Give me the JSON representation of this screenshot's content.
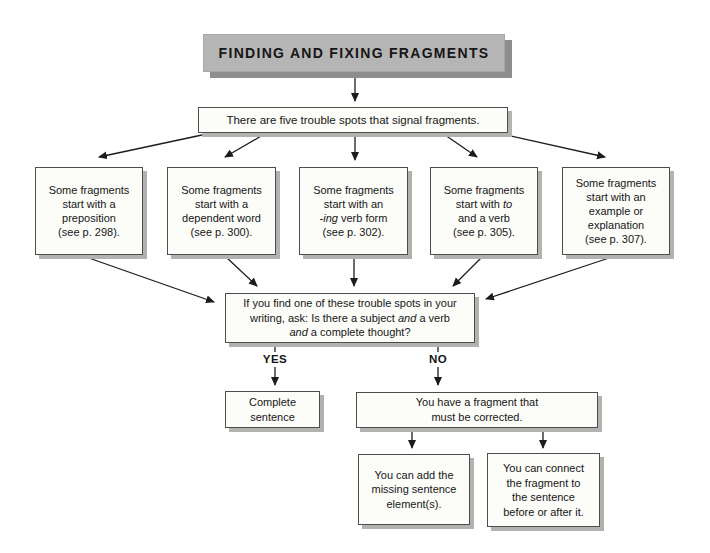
{
  "title": {
    "label": "FINDING AND FIXING FRAGMENTS"
  },
  "intro": {
    "text": "There are five trouble spots that signal fragments."
  },
  "spots": [
    {
      "id": "preposition",
      "lines": [
        [
          {
            "t": "Some fragments"
          }
        ],
        [
          {
            "t": "start with a"
          }
        ],
        [
          {
            "t": "preposition"
          }
        ],
        [
          {
            "t": "(see p. 298)."
          }
        ]
      ]
    },
    {
      "id": "dependent-word",
      "lines": [
        [
          {
            "t": "Some fragments"
          }
        ],
        [
          {
            "t": "start with a"
          }
        ],
        [
          {
            "t": "dependent word"
          }
        ],
        [
          {
            "t": "(see p. 300)."
          }
        ]
      ]
    },
    {
      "id": "ing-verb-form",
      "lines": [
        [
          {
            "t": "Some fragments"
          }
        ],
        [
          {
            "t": "start with an"
          }
        ],
        [
          {
            "t": "-ing",
            "i": true
          },
          {
            "t": " verb form"
          }
        ],
        [
          {
            "t": "(see p. 302)."
          }
        ]
      ]
    },
    {
      "id": "to-and-a-verb",
      "lines": [
        [
          {
            "t": "Some fragments"
          }
        ],
        [
          {
            "t": "start with "
          },
          {
            "t": "to",
            "i": true
          }
        ],
        [
          {
            "t": "and a verb"
          }
        ],
        [
          {
            "t": "(see p. 305)."
          }
        ]
      ]
    },
    {
      "id": "example-or-explanation",
      "lines": [
        [
          {
            "t": "Some fragments"
          }
        ],
        [
          {
            "t": "start with an"
          }
        ],
        [
          {
            "t": "example or"
          }
        ],
        [
          {
            "t": "explanation"
          }
        ],
        [
          {
            "t": "(see p. 307)."
          }
        ]
      ]
    }
  ],
  "question": {
    "lines": [
      [
        {
          "t": "If you find one of these trouble spots in your"
        }
      ],
      [
        {
          "t": "writing, ask: Is there a subject "
        },
        {
          "t": "and",
          "i": true
        },
        {
          "t": " a verb"
        }
      ],
      [
        {
          "t": "and",
          "i": true
        },
        {
          "t": " a complete thought?"
        }
      ]
    ]
  },
  "branches": {
    "yes_label": "YES",
    "no_label": "NO"
  },
  "outcomes": {
    "complete": {
      "lines": [
        [
          {
            "t": "Complete"
          }
        ],
        [
          {
            "t": "sentence"
          }
        ]
      ]
    },
    "fragment": {
      "lines": [
        [
          {
            "t": "You have a fragment that"
          }
        ],
        [
          {
            "t": "must be corrected."
          }
        ]
      ]
    },
    "fix_add": {
      "lines": [
        [
          {
            "t": "You can add the"
          }
        ],
        [
          {
            "t": "missing sentence"
          }
        ],
        [
          {
            "t": "element(s)."
          }
        ]
      ]
    },
    "fix_connect": {
      "lines": [
        [
          {
            "t": "You can connect"
          }
        ],
        [
          {
            "t": "the fragment to"
          }
        ],
        [
          {
            "t": "the sentence"
          }
        ],
        [
          {
            "t": "before or after it."
          }
        ]
      ]
    }
  },
  "colors": {
    "background": "#ffffff",
    "box_fill": "#fcfcf9",
    "box_border": "#4d4d4d",
    "box_shadow": "#b2b2b0",
    "title_fill": "#b5b5b5",
    "title_shadow": "#8d8d8d",
    "arrow": "#1c1c1c",
    "text": "#161616"
  }
}
